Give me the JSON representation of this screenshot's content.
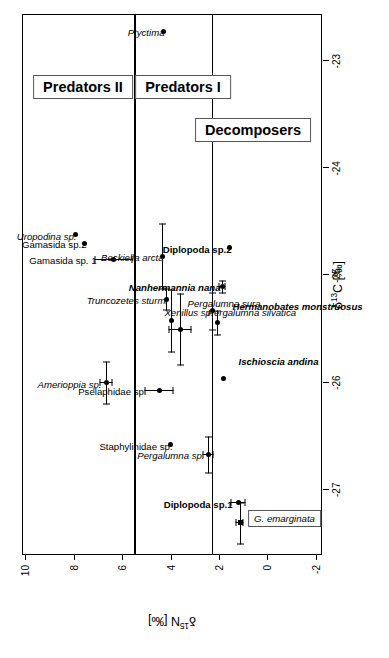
{
  "figure": {
    "orientation": "rotated-90-ccw",
    "background": "#ffffff",
    "foreground": "#000000"
  },
  "axes": {
    "x": {
      "label_html": "δ<sup>13</sup>C [‰]",
      "label_text": "δ13C [‰]",
      "ticks": [
        "-27",
        "-26",
        "-25",
        "-24",
        "-23"
      ],
      "tick_values": [
        -27,
        -26,
        -25,
        -24,
        -23
      ],
      "range": [
        -27.6,
        -22.55
      ]
    },
    "y": {
      "label_html": "δ<sup>15</sup>N [‰]",
      "label_text": "δ15N [‰]",
      "ticks": [
        "10",
        "8",
        "6",
        "4",
        "2",
        "0",
        "-2"
      ],
      "tick_values": [
        10,
        8,
        6,
        4,
        2,
        0,
        -2
      ],
      "range": [
        -2.3,
        10.1
      ]
    }
  },
  "group_boxes": [
    {
      "label": "Predators II",
      "x": -23.35,
      "y": 8.1
    },
    {
      "label": "Predators I",
      "x": -23.35,
      "y": 4.0
    },
    {
      "label": "Decomposers",
      "x": -23.75,
      "y": 1.1
    }
  ],
  "dividers": [
    {
      "name": "predators-ii-divider",
      "y": 5.5
    },
    {
      "name": "predators-i-divider",
      "y": 2.3
    }
  ],
  "inset_box": {
    "label": "G. emarginata",
    "x": -27.35,
    "y": -0.35
  },
  "chart_data": {
    "type": "scatter",
    "title": "",
    "xlabel": "δ13C [‰]",
    "ylabel": "δ15N [‰]",
    "xlim": [
      -27.6,
      -22.55
    ],
    "ylim": [
      -2.3,
      10.1
    ],
    "grid": false,
    "legend": "none",
    "group_dividers_y": [
      5.5,
      2.3
    ],
    "groups": [
      "Predators II",
      "Predators I",
      "Decomposers"
    ],
    "points": [
      {
        "label": "Ptyctima",
        "group": "Predators I",
        "x": -22.72,
        "y": 4.3,
        "xerr": 0.0,
        "yerr": 0.0,
        "marker": "circle",
        "style": "italic",
        "label_pos": "left"
      },
      {
        "label": "Uropodina sp.",
        "group": "Predators II",
        "x": -24.62,
        "y": 7.95,
        "xerr": 0.0,
        "yerr": 0.0,
        "marker": "circle",
        "style": "italic",
        "label_pos": "left"
      },
      {
        "label": "Gamasida sp.2",
        "group": "Predators II",
        "x": -24.7,
        "y": 7.55,
        "xerr": 0.0,
        "yerr": 0.0,
        "marker": "circle",
        "style": "upright",
        "label_pos": "left"
      },
      {
        "label": "Gamasida sp. 1",
        "group": "Predators II",
        "x": -24.85,
        "y": 6.35,
        "xerr": 0.0,
        "yerr": 0.78,
        "marker": "circle",
        "style": "upright",
        "label_pos": "left"
      },
      {
        "label": "Amerioppia sp.",
        "group": "Predators II",
        "x": -26.0,
        "y": 6.65,
        "xerr": 0.2,
        "yerr": 0.28,
        "marker": "circle",
        "style": "italic",
        "label_pos": "left"
      },
      {
        "label": "Beckiella arcta",
        "group": "Predators I",
        "x": -24.82,
        "y": 4.35,
        "xerr": 0.31,
        "yerr": 0.0,
        "marker": "circle",
        "style": "italic",
        "label_pos": "left"
      },
      {
        "label": "Truncozetes sturmi",
        "group": "Predators I",
        "x": -25.22,
        "y": 4.18,
        "xerr": 0.1,
        "yerr": 0.0,
        "marker": "circle",
        "style": "italic",
        "label_pos": "left"
      },
      {
        "label": "Pergalumna sura",
        "group": "Predators I",
        "x": -25.42,
        "y": 3.95,
        "xerr": 0.29,
        "yerr": 0.0,
        "marker": "circle",
        "style": "italic",
        "label_pos": "right"
      },
      {
        "label": "Pergalumna silvatica",
        "group": "Predators I",
        "x": -25.5,
        "y": 3.6,
        "xerr": 0.34,
        "yerr": 0.47,
        "marker": "circle",
        "style": "italic",
        "label_pos": "right"
      },
      {
        "label": "Pselaphidae sp.",
        "group": "Predators I",
        "x": -26.07,
        "y": 4.45,
        "xerr": 0.0,
        "yerr": 0.6,
        "marker": "circle",
        "style": "upright",
        "label_pos": "left"
      },
      {
        "label": "Staphylinidae sp.",
        "group": "Predators I",
        "x": -26.58,
        "y": 4.0,
        "xerr": 0.0,
        "yerr": 0.0,
        "marker": "circle",
        "style": "upright",
        "label_pos": "left"
      },
      {
        "label": "Pergalumna sp.",
        "group": "Predators I",
        "x": -26.67,
        "y": 2.45,
        "xerr": 0.17,
        "yerr": 0.23,
        "marker": "circle",
        "style": "italic",
        "label_pos": "left"
      },
      {
        "label": "Xenillus sp.",
        "group": "Decomposers",
        "x": -25.33,
        "y": 2.28,
        "xerr": 0.18,
        "yerr": 0.0,
        "marker": "circle",
        "style": "italic",
        "label_pos": "left"
      },
      {
        "label": "Nanhermannia nana",
        "group": "Decomposers",
        "x": -25.1,
        "y": 1.85,
        "xerr": 0.06,
        "yerr": 0.16,
        "marker": "circle",
        "style": "bold-italic",
        "label_pos": "left"
      },
      {
        "label": "Hermanobates monstruosus",
        "group": "Decomposers",
        "x": -25.44,
        "y": 2.07,
        "xerr": 0.12,
        "yerr": 0.0,
        "marker": "circle",
        "style": "bold-italic",
        "label_pos": "right"
      },
      {
        "label": "Ischioscia andina",
        "group": "Decomposers",
        "x": -25.96,
        "y": 1.82,
        "xerr": 0.0,
        "yerr": 0.0,
        "marker": "circle",
        "style": "bold-italic",
        "label_pos": "right"
      },
      {
        "label": "Diplopoda sp.2",
        "group": "Decomposers",
        "x": -24.74,
        "y": 1.55,
        "xerr": 0.0,
        "yerr": 0.0,
        "marker": "circle",
        "style": "bold",
        "label_pos": "left"
      },
      {
        "label": "Diplopoda sp.1",
        "group": "Decomposers",
        "x": -27.12,
        "y": 1.2,
        "xerr": 0.0,
        "yerr": 0.3,
        "marker": "circle",
        "style": "bold",
        "label_pos": "left"
      },
      {
        "label": "G. emarginata",
        "group": "Decomposers",
        "x": -27.31,
        "y": 1.13,
        "xerr": 0.2,
        "yerr": 0.18,
        "marker": "square",
        "style": "inset",
        "label_pos": "none"
      }
    ]
  }
}
